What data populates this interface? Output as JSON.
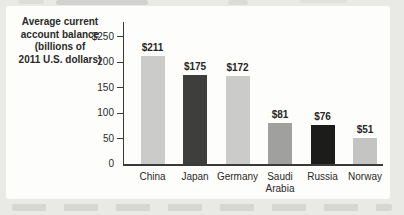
{
  "figure": {
    "background": "#e9e9e6",
    "panel_background": "#fdfdfb"
  },
  "chart_data": {
    "type": "bar",
    "title": "Average current account balance (billions of 2011 U.S. dollars)",
    "title_lines": [
      "Average current",
      "account balance",
      "(billions of",
      "2011 U.S. dollars)"
    ],
    "ylabel": "Average current account balance (billions of 2011 U.S. dollars)",
    "xlabel": "",
    "categories": [
      "China",
      "Japan",
      "Germany",
      "Saudi Arabia",
      "Russia",
      "Norway"
    ],
    "values": [
      211,
      175,
      172,
      81,
      76,
      51
    ],
    "value_labels": [
      "$211",
      "$175",
      "$172",
      "$81",
      "$76",
      "$51"
    ],
    "bar_colors": [
      "#cbcbc9",
      "#3e3e3d",
      "#cbcbc9",
      "#a0a09e",
      "#1c1c1b",
      "#c4c4c2"
    ],
    "y_axis": {
      "range": [
        0,
        250
      ],
      "ticks": [
        {
          "value": 250,
          "label": "$250"
        },
        {
          "value": 200,
          "label": "200"
        },
        {
          "value": 150,
          "label": "150"
        },
        {
          "value": 100,
          "label": "100"
        },
        {
          "value": 50,
          "label": "50"
        },
        {
          "value": 0,
          "label": "0"
        }
      ]
    },
    "grid": false,
    "legend": "none",
    "text_color": "#2a2a28",
    "axis_color": "#3a3a38"
  }
}
